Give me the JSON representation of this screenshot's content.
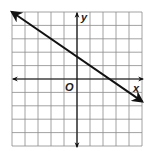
{
  "graph": {
    "x_label": "x",
    "y_label": "y",
    "origin_label": "O",
    "x_range": [
      -5,
      5
    ],
    "y_range": [
      -5,
      5
    ],
    "grid_step": 1,
    "grid_color": "#8a8a8a",
    "axis_color": "#111111",
    "line_color": "#111111"
  },
  "chart_data": {
    "type": "line",
    "title": "",
    "xlabel": "x",
    "ylabel": "y",
    "xlim": [
      -5,
      5
    ],
    "ylim": [
      -5,
      5
    ],
    "grid": true,
    "series": [
      {
        "name": "y = -2/3 x + 5/3",
        "equation": "2x + 3y = 5",
        "slope": -0.6667,
        "y_intercept": 1.6667,
        "x_intercept": 2.5,
        "x": [
          -5,
          -2,
          1,
          4,
          5
        ],
        "y": [
          5,
          3,
          1,
          -1,
          -1.6667
        ],
        "arrows_both_ends": true
      }
    ]
  }
}
